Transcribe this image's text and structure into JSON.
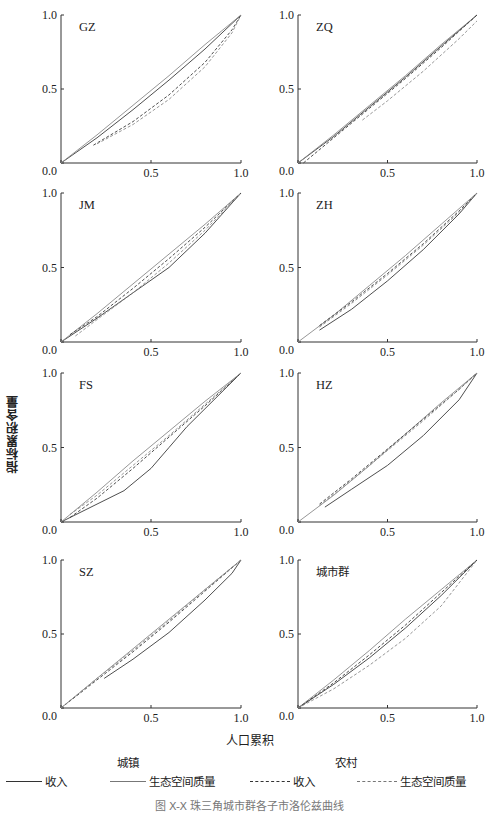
{
  "figure": {
    "ylabel": "指标累积含量",
    "xlabel": "人口累积",
    "caption": "图 X-X 珠三角城市群各子市洛伦兹曲线",
    "legend": {
      "group_urban": "城镇",
      "group_rural": "农村",
      "items": [
        {
          "label": "收入",
          "group": "城镇",
          "style": "solid",
          "color": "#333333"
        },
        {
          "label": "生态空间质量",
          "group": "城镇",
          "style": "solid",
          "color": "#777777"
        },
        {
          "label": "收入",
          "group": "农村",
          "style": "dashed",
          "color": "#333333"
        },
        {
          "label": "生态空间质量",
          "group": "农村",
          "style": "dashed",
          "color": "#777777"
        }
      ]
    }
  },
  "chart_data": {
    "type": "line",
    "title": "",
    "xlabel": "人口累积",
    "ylabel": "指标累积含量",
    "xlim": [
      0,
      1
    ],
    "ylim": [
      0,
      1
    ],
    "xticks": [
      "0.0",
      "0.5",
      "1.0"
    ],
    "yticks": [
      "0.0",
      "0.5",
      "1.0"
    ],
    "grid": false,
    "legend_position": "bottom",
    "series_names": [
      "城镇-收入",
      "城镇-生态空间质量",
      "农村-收入",
      "农村-生态空间质量"
    ],
    "panels": [
      {
        "name": "GZ",
        "series": [
          {
            "name": "城镇-收入",
            "x": [
              0.0,
              0.2,
              0.4,
              0.6,
              0.8,
              1.0
            ],
            "y": [
              0.0,
              0.17,
              0.36,
              0.56,
              0.77,
              1.0
            ]
          },
          {
            "name": "城镇-生态空间质量",
            "x": [
              0.0,
              0.2,
              0.4,
              0.6,
              0.8,
              1.0
            ],
            "y": [
              0.0,
              0.19,
              0.39,
              0.59,
              0.8,
              1.0
            ]
          },
          {
            "name": "农村-收入",
            "x": [
              0.18,
              0.4,
              0.6,
              0.8,
              0.95,
              1.0
            ],
            "y": [
              0.12,
              0.28,
              0.46,
              0.68,
              0.9,
              1.0
            ]
          },
          {
            "name": "农村-生态空间质量",
            "x": [
              0.2,
              0.4,
              0.6,
              0.8,
              0.95,
              1.0
            ],
            "y": [
              0.13,
              0.26,
              0.43,
              0.65,
              0.88,
              1.0
            ]
          }
        ]
      },
      {
        "name": "ZQ",
        "series": [
          {
            "name": "城镇-收入",
            "x": [
              0.0,
              0.2,
              0.4,
              0.6,
              0.8,
              1.0
            ],
            "y": [
              0.0,
              0.18,
              0.38,
              0.58,
              0.79,
              1.0
            ]
          },
          {
            "name": "城镇-生态空间质量",
            "x": [
              0.0,
              0.2,
              0.4,
              0.6,
              0.8,
              1.0
            ],
            "y": [
              0.0,
              0.19,
              0.39,
              0.59,
              0.8,
              1.0
            ]
          },
          {
            "name": "农村-收入",
            "x": [
              0.03,
              0.2,
              0.4,
              0.6,
              0.8,
              1.0
            ],
            "y": [
              0.0,
              0.17,
              0.37,
              0.57,
              0.78,
              1.0
            ]
          },
          {
            "name": "农村-生态空间质量",
            "x": [
              0.36,
              0.5,
              0.7,
              0.9,
              1.0
            ],
            "y": [
              0.29,
              0.42,
              0.62,
              0.84,
              0.96
            ]
          }
        ]
      },
      {
        "name": "JM",
        "series": [
          {
            "name": "城镇-收入",
            "x": [
              0.0,
              0.2,
              0.4,
              0.6,
              0.8,
              1.0
            ],
            "y": [
              0.0,
              0.16,
              0.33,
              0.5,
              0.73,
              1.0
            ]
          },
          {
            "name": "城镇-生态空间质量",
            "x": [
              0.0,
              0.2,
              0.4,
              0.6,
              0.8,
              1.0
            ],
            "y": [
              0.0,
              0.19,
              0.39,
              0.59,
              0.79,
              1.0
            ]
          },
          {
            "name": "农村-收入",
            "x": [
              0.05,
              0.2,
              0.4,
              0.6,
              0.8,
              1.0
            ],
            "y": [
              0.05,
              0.17,
              0.36,
              0.56,
              0.77,
              1.0
            ]
          },
          {
            "name": "农村-生态空间质量",
            "x": [
              0.08,
              0.2,
              0.4,
              0.6,
              0.8,
              1.0
            ],
            "y": [
              0.04,
              0.15,
              0.33,
              0.53,
              0.75,
              1.0
            ]
          }
        ]
      },
      {
        "name": "ZH",
        "series": [
          {
            "name": "城镇-收入",
            "x": [
              0.12,
              0.3,
              0.5,
              0.7,
              0.9,
              1.0
            ],
            "y": [
              0.08,
              0.22,
              0.41,
              0.62,
              0.86,
              1.0
            ]
          },
          {
            "name": "城镇-生态空间质量",
            "x": [
              0.0,
              0.2,
              0.4,
              0.6,
              0.8,
              1.0
            ],
            "y": [
              0.0,
              0.18,
              0.38,
              0.58,
              0.79,
              1.0
            ]
          },
          {
            "name": "农村-收入",
            "x": [
              0.12,
              0.3,
              0.5,
              0.7,
              0.9,
              1.0
            ],
            "y": [
              0.11,
              0.27,
              0.46,
              0.66,
              0.88,
              1.0
            ]
          },
          {
            "name": "农村-生态空间质量",
            "x": [
              0.12,
              0.3,
              0.5,
              0.7,
              0.9,
              1.0
            ],
            "y": [
              0.1,
              0.26,
              0.45,
              0.65,
              0.87,
              1.0
            ]
          }
        ]
      },
      {
        "name": "FS",
        "series": [
          {
            "name": "城镇-收入",
            "x": [
              0.0,
              0.2,
              0.35,
              0.5,
              0.6,
              0.7,
              0.85,
              1.0
            ],
            "y": [
              0.0,
              0.12,
              0.21,
              0.36,
              0.5,
              0.64,
              0.82,
              1.0
            ]
          },
          {
            "name": "城镇-生态空间质量",
            "x": [
              0.0,
              0.2,
              0.4,
              0.6,
              0.8,
              1.0
            ],
            "y": [
              0.0,
              0.2,
              0.41,
              0.61,
              0.81,
              1.0
            ]
          },
          {
            "name": "农村-收入",
            "x": [
              0.05,
              0.2,
              0.4,
              0.6,
              0.8,
              1.0
            ],
            "y": [
              0.03,
              0.16,
              0.36,
              0.57,
              0.78,
              1.0
            ]
          },
          {
            "name": "农村-生态空间质量",
            "x": [
              0.05,
              0.2,
              0.4,
              0.6,
              0.8,
              1.0
            ],
            "y": [
              0.05,
              0.18,
              0.38,
              0.58,
              0.79,
              1.0
            ]
          }
        ]
      },
      {
        "name": "HZ",
        "series": [
          {
            "name": "城镇-收入",
            "x": [
              0.15,
              0.3,
              0.5,
              0.7,
              0.9,
              1.0
            ],
            "y": [
              0.1,
              0.22,
              0.38,
              0.58,
              0.82,
              1.0
            ]
          },
          {
            "name": "城镇-生态空间质量",
            "x": [
              0.0,
              0.2,
              0.4,
              0.6,
              0.8,
              1.0
            ],
            "y": [
              0.0,
              0.18,
              0.38,
              0.59,
              0.8,
              1.0
            ]
          },
          {
            "name": "农村-收入",
            "x": [
              0.12,
              0.3,
              0.5,
              0.7,
              0.9,
              1.0
            ],
            "y": [
              0.12,
              0.29,
              0.49,
              0.69,
              0.89,
              1.0
            ]
          },
          {
            "name": "农村-生态空间质量",
            "x": [
              0.12,
              0.3,
              0.5,
              0.7,
              0.9,
              1.0
            ],
            "y": [
              0.11,
              0.28,
              0.48,
              0.68,
              0.89,
              1.0
            ]
          }
        ]
      },
      {
        "name": "SZ",
        "series": [
          {
            "name": "城镇-收入",
            "x": [
              0.24,
              0.4,
              0.6,
              0.8,
              0.95,
              1.0
            ],
            "y": [
              0.2,
              0.33,
              0.51,
              0.73,
              0.91,
              1.0
            ]
          },
          {
            "name": "城镇-生态空间质量",
            "x": [
              0.0,
              0.2,
              0.4,
              0.6,
              0.8,
              1.0
            ],
            "y": [
              0.0,
              0.2,
              0.4,
              0.6,
              0.8,
              1.0
            ]
          },
          {
            "name": "农村-收入",
            "x": [
              0.0,
              0.2,
              0.4,
              0.6,
              0.8,
              1.0
            ],
            "y": [
              0.0,
              0.19,
              0.38,
              0.58,
              0.79,
              1.0
            ]
          },
          {
            "name": "农村-生态空间质量",
            "x": [
              0.0,
              0.2,
              0.4,
              0.6,
              0.8,
              1.0
            ],
            "y": [
              0.0,
              0.2,
              0.39,
              0.59,
              0.8,
              1.0
            ]
          }
        ]
      },
      {
        "name": "城市群",
        "series": [
          {
            "name": "城镇-收入",
            "x": [
              0.0,
              0.2,
              0.4,
              0.6,
              0.8,
              1.0
            ],
            "y": [
              0.0,
              0.16,
              0.34,
              0.54,
              0.76,
              1.0
            ]
          },
          {
            "name": "城镇-生态空间质量",
            "x": [
              0.0,
              0.2,
              0.4,
              0.6,
              0.8,
              1.0
            ],
            "y": [
              0.0,
              0.19,
              0.39,
              0.6,
              0.8,
              1.0
            ]
          },
          {
            "name": "农村-收入",
            "x": [
              0.0,
              0.2,
              0.4,
              0.6,
              0.8,
              1.0
            ],
            "y": [
              0.0,
              0.17,
              0.36,
              0.56,
              0.78,
              1.0
            ]
          },
          {
            "name": "农村-生态空间质量",
            "x": [
              0.0,
              0.2,
              0.4,
              0.6,
              0.8,
              1.0
            ],
            "y": [
              0.0,
              0.13,
              0.29,
              0.47,
              0.69,
              1.0
            ]
          }
        ]
      }
    ]
  }
}
